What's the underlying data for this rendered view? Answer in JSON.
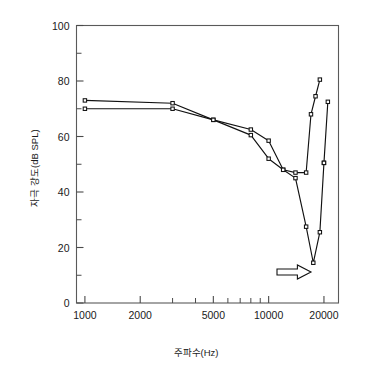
{
  "chart_data": {
    "type": "line",
    "title": "",
    "xlabel": "주파수(Hz)",
    "ylabel": "자극 강도(dB SPL)",
    "xscale": "log",
    "xlim": [
      900,
      24000
    ],
    "ylim": [
      0,
      100
    ],
    "grid": false,
    "legend": "none",
    "x_ticks": [
      {
        "value": 1000,
        "label": "1000",
        "major": true
      },
      {
        "value": 2000,
        "label": "2000",
        "major": true
      },
      {
        "value": 3000,
        "label": "",
        "major": false
      },
      {
        "value": 4000,
        "label": "",
        "major": false
      },
      {
        "value": 5000,
        "label": "5000",
        "major": true
      },
      {
        "value": 6000,
        "label": "",
        "major": false
      },
      {
        "value": 7000,
        "label": "",
        "major": false
      },
      {
        "value": 8000,
        "label": "",
        "major": false
      },
      {
        "value": 9000,
        "label": "",
        "major": false
      },
      {
        "value": 10000,
        "label": "10000",
        "major": true
      },
      {
        "value": 20000,
        "label": "20000",
        "major": true
      }
    ],
    "y_ticks": [
      {
        "value": 0,
        "label": "0",
        "major": true
      },
      {
        "value": 10,
        "label": "",
        "major": false
      },
      {
        "value": 20,
        "label": "20",
        "major": true
      },
      {
        "value": 30,
        "label": "",
        "major": false
      },
      {
        "value": 40,
        "label": "40",
        "major": true
      },
      {
        "value": 50,
        "label": "",
        "major": false
      },
      {
        "value": 60,
        "label": "60",
        "major": true
      },
      {
        "value": 70,
        "label": "",
        "major": false
      },
      {
        "value": 80,
        "label": "80",
        "major": true
      },
      {
        "value": 90,
        "label": "",
        "major": false
      },
      {
        "value": 100,
        "label": "100",
        "major": true
      }
    ],
    "series": [
      {
        "name": "series-upper",
        "marker": "square-open",
        "x": [
          1000,
          3000,
          5000,
          8000,
          10000,
          12000,
          14000,
          16000,
          17000,
          18000,
          19000
        ],
        "y": [
          73,
          72,
          66,
          62.5,
          58.5,
          48,
          47,
          47,
          68,
          74.5,
          80.5
        ]
      },
      {
        "name": "series-lower",
        "marker": "square-open",
        "x": [
          1000,
          3000,
          5000,
          8000,
          10000,
          12000,
          14000,
          16000,
          17500,
          19000,
          20000
        ],
        "y": [
          70,
          70,
          66,
          60.5,
          52,
          48,
          45,
          27.5,
          14.5,
          25.5,
          50.5
        ]
      },
      {
        "name": "series-lower-tail",
        "marker": "square-open",
        "x": [
          20000,
          21000
        ],
        "y": [
          50.5,
          72.5
        ]
      }
    ],
    "annotations": [
      {
        "name": "notch-arrow",
        "shape": "right-arrow-outline",
        "x_px": 277,
        "y_px": 272,
        "width_px": 34,
        "height_px": 14,
        "color": "#111111"
      }
    ],
    "colors": {
      "line": "#111111",
      "axis": "#5a5a5a",
      "text": "#1a1a1a",
      "background": "#ffffff"
    }
  }
}
